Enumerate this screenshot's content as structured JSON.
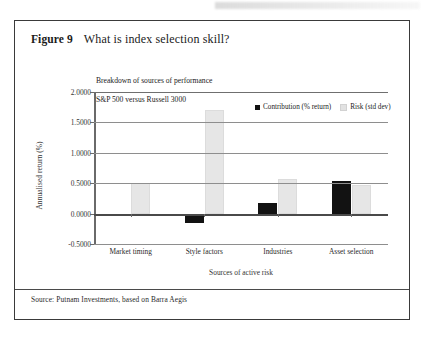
{
  "figure": {
    "number_label": "Figure 9",
    "title": "What is index selection skill?",
    "source_note": "Source: Putnam Investments, based on Barra Aegis"
  },
  "chart_data": {
    "type": "bar",
    "title": "Breakdown of sources of performance\nS&P 500 versus Russell 3000",
    "subtitle_line1": "Breakdown of sources of performance",
    "subtitle_line2": "S&P 500 versus Russell 3000",
    "xlabel": "Sources of active risk",
    "ylabel": "Annualised return (%)",
    "categories": [
      "Market timing",
      "Style factors",
      "Industries",
      "Asset selection"
    ],
    "series": [
      {
        "name": "Contribution (% return)",
        "color": "#121212",
        "values": [
          -0.04,
          -0.16,
          0.18,
          0.53
        ]
      },
      {
        "name": "Risk (std dev)",
        "color": "#e6e6e6",
        "values": [
          0.5,
          1.7,
          0.57,
          0.47
        ]
      }
    ],
    "ylim": [
      -0.5,
      2.0
    ],
    "yticks": [
      2.0,
      1.5,
      1.0,
      0.5,
      0.0,
      -0.5
    ],
    "ytick_labels": [
      "2.0000",
      "1.5000",
      "1.0000",
      "0.5000",
      "0.0000",
      "-0.5000"
    ],
    "grid": true,
    "legend_position": "top-right"
  }
}
